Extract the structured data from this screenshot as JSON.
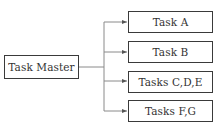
{
  "diagram": {
    "type": "tree",
    "root": {
      "label": "Task Master"
    },
    "children": [
      {
        "label": "Task A"
      },
      {
        "label": "Task B"
      },
      {
        "label": "Tasks C,D,E"
      },
      {
        "label": "Tasks F,G"
      }
    ],
    "colors": {
      "line": "#8a8a8a",
      "border": "#3a3a3a",
      "text": "#333333",
      "background": "#ffffff"
    }
  }
}
